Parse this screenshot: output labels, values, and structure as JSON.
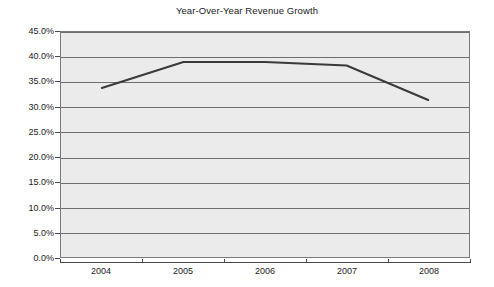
{
  "chart_data": {
    "type": "line",
    "title": "Year-Over-Year Revenue Growth",
    "xlabel": "",
    "ylabel": "",
    "categories": [
      "2004",
      "2005",
      "2006",
      "2007",
      "2008"
    ],
    "values": [
      33.8,
      39.0,
      39.0,
      38.3,
      31.4
    ],
    "series": [
      {
        "name": "Revenue Growth",
        "values": [
          33.8,
          39.0,
          39.0,
          38.3,
          31.4
        ]
      }
    ],
    "ylim": [
      0.0,
      45.0
    ],
    "ytick_values": [
      0.0,
      5.0,
      10.0,
      15.0,
      20.0,
      25.0,
      30.0,
      35.0,
      40.0,
      45.0
    ],
    "ytick_labels": [
      "0.0%",
      "5.0%",
      "10.0%",
      "15.0%",
      "20.0%",
      "25.0%",
      "30.0%",
      "35.0%",
      "40.0%",
      "45.0%"
    ],
    "grid": true,
    "grid_axis": "y",
    "legend": false,
    "legend_position": "none",
    "plot_background": "#ebebeb",
    "line_color": "#3a3a3a",
    "gridline_color": "#6e6e6e",
    "axis_color": "#4a4a4a",
    "annotations": []
  }
}
